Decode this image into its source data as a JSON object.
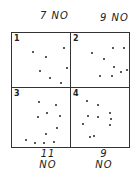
{
  "top_labels": [
    {
      "count": "7",
      "text": "NO"
    },
    {
      "count": "9",
      "text": "NO"
    }
  ],
  "bottom_labels": [
    {
      "count": "11",
      "text": "NO"
    },
    {
      "count": "9",
      "text": "NO"
    }
  ],
  "quadrants": [
    {
      "number": "1",
      "dots": [
        [
          20,
          18
        ],
        [
          33,
          23
        ],
        [
          51,
          14
        ],
        [
          54,
          34
        ],
        [
          27,
          37
        ],
        [
          37,
          44
        ],
        [
          48,
          49
        ]
      ]
    },
    {
      "number": "2",
      "dots": [
        [
          20,
          19
        ],
        [
          41,
          14
        ],
        [
          52,
          14
        ],
        [
          32,
          25
        ],
        [
          42,
          33
        ],
        [
          28,
          42
        ],
        [
          40,
          42
        ],
        [
          49,
          38
        ],
        [
          55,
          36
        ]
      ]
    },
    {
      "number": "3",
      "dots": [
        [
          26,
          13
        ],
        [
          43,
          16
        ],
        [
          34,
          24
        ],
        [
          25,
          28
        ],
        [
          47,
          27
        ],
        [
          44,
          39
        ],
        [
          33,
          45
        ],
        [
          13,
          51
        ],
        [
          22,
          54
        ],
        [
          31,
          54
        ],
        [
          41,
          53
        ]
      ]
    },
    {
      "number": "4",
      "dots": [
        [
          15,
          12
        ],
        [
          26,
          16
        ],
        [
          16,
          27
        ],
        [
          26,
          28
        ],
        [
          38,
          24
        ],
        [
          39,
          30
        ],
        [
          11,
          35
        ],
        [
          38,
          36
        ],
        [
          22,
          47
        ],
        [
          18,
          48
        ]
      ]
    }
  ]
}
